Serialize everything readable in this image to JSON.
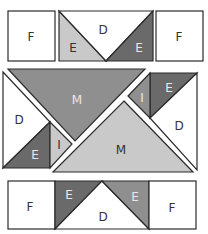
{
  "diagram": {
    "colors": {
      "outline": "#2b2b2b",
      "white": "#ffffff",
      "light": "#c9c9c9",
      "medium": "#8f8f8f",
      "dark": "#6a6a6a",
      "label_dark": "#333333",
      "label_light": "#e8e8e8"
    },
    "top_row": {
      "left_square": "F",
      "left_triangle": "E",
      "center_triangle": "D",
      "right_triangle": "E",
      "right_square": "F"
    },
    "middle": {
      "top_large_triangle": "M",
      "bottom_large_triangle": "M",
      "left_block": {
        "upper": "D",
        "lower_triangle": "E",
        "strip": "I"
      },
      "right_block": {
        "upper_triangle": "E",
        "strip": "I",
        "lower": "D"
      }
    },
    "bottom_row": {
      "left_square": "F",
      "left_triangle": "E",
      "center_triangle": "D",
      "right_triangle": "E",
      "right_square": "F"
    }
  }
}
